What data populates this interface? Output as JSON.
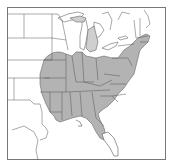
{
  "map": {
    "type": "range-map",
    "region": "Eastern United States",
    "colors": {
      "background": "#ffffff",
      "land": "#ffffff",
      "range_fill": "#b3b3b3",
      "border": "#555555",
      "frame": "#777777"
    },
    "frame": {
      "x": 7,
      "y": 7,
      "width": 159,
      "height": 153
    },
    "range_label": "Shaded range",
    "range_states": [
      "Missouri",
      "Illinois",
      "Indiana",
      "Ohio",
      "Kentucky",
      "Tennessee",
      "Arkansas",
      "Louisiana",
      "Mississippi",
      "Alabama",
      "Georgia",
      "Florida",
      "South Carolina",
      "North Carolina",
      "Virginia",
      "West Virginia",
      "Maryland",
      "Delaware",
      "Pennsylvania",
      "New Jersey",
      "New York",
      "Connecticut",
      "Rhode Island",
      "Massachusetts",
      "Oklahoma",
      "Kansas",
      "Iowa",
      "Michigan"
    ],
    "unshaded_areas": [
      "Minnesota",
      "Wisconsin",
      "North Dakota",
      "South Dakota",
      "Nebraska",
      "Texas",
      "Vermont",
      "New Hampshire",
      "Maine",
      "South Florida peninsula"
    ]
  }
}
